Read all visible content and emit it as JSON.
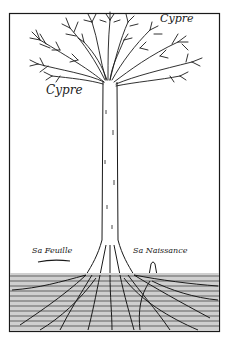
{
  "illustration": {
    "subject": "cypress tree engraving with root system",
    "labels": {
      "top_name": "Cypre",
      "trunk_name": "Cypre",
      "leaf_caption": "Sa Feuille",
      "birth_caption": "Sa Naissance"
    },
    "colors": {
      "ink": "#1a1a1a",
      "paper": "#ffffff"
    }
  }
}
